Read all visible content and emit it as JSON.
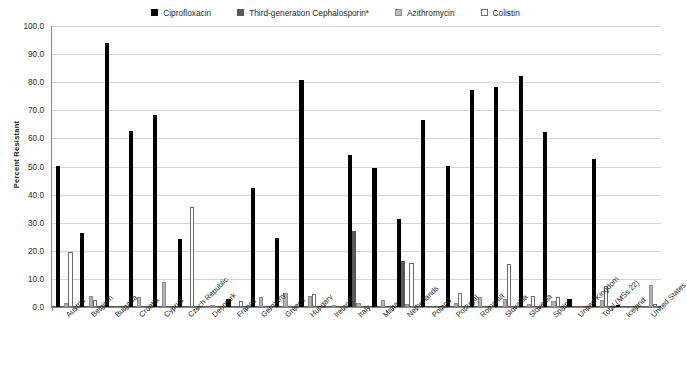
{
  "chart_data": {
    "type": "bar",
    "title": "",
    "xlabel": "",
    "ylabel": "Percent Resistant",
    "ylim": [
      0,
      100
    ],
    "yticks": [
      "0.0",
      "10.0",
      "20.0",
      "30.0",
      "40.0",
      "50.0",
      "60.0",
      "70.0",
      "80.0",
      "90.0",
      "100.0"
    ],
    "grid": true,
    "legend_position": "top-center",
    "categories": [
      "Austria",
      "Belgium",
      "Bulgaria",
      "Croatia",
      "Cyprus",
      "Czech Republic",
      "Denmark",
      "France",
      "Germany",
      "Greece",
      "Hungary",
      "Ireland",
      "Italy",
      "Malta",
      "Netherlands",
      "Poland",
      "Portugal",
      "Romania",
      "Slovakia",
      "Slovenia",
      "Spain",
      "United Kingdom",
      "Total (MSs 22)",
      "Iceland",
      "United States"
    ],
    "series": [
      {
        "name": "Ciprofloxacin",
        "color": "#000000",
        "values": [
          50.3,
          26.2,
          94.0,
          62.5,
          68.5,
          24.3,
          0.0,
          2.8,
          42.5,
          24.7,
          80.7,
          0.0,
          54.0,
          49.5,
          31.2,
          66.5,
          50.3,
          77.3,
          78.3,
          82.3,
          62.3,
          2.8,
          52.5,
          0.6,
          0.0
        ]
      },
      {
        "name": "Third-generation Cephalosporin*",
        "color": "#58585a",
        "values": [
          0.0,
          0.0,
          0.0,
          0.0,
          0.0,
          0.0,
          0.0,
          0.0,
          0.0,
          0.0,
          0.0,
          0.0,
          27.0,
          0.0,
          16.5,
          0.0,
          0.0,
          0.0,
          0.0,
          0.0,
          0.0,
          0.0,
          0.0,
          0.0,
          0.0
        ]
      },
      {
        "name": "Azithromycin",
        "color": "#b4b4b4",
        "values": [
          1.5,
          4.0,
          0.0,
          3.5,
          9.0,
          0.0,
          0.3,
          0.0,
          3.5,
          5.0,
          4.0,
          0.4,
          1.5,
          2.5,
          1.2,
          0.0,
          1.5,
          3.5,
          3.0,
          1.0,
          2.0,
          0.0,
          2.5,
          0.0,
          8.0
        ]
      },
      {
        "name": "Colistin",
        "color": "#ffffff",
        "values": [
          19.5,
          2.5,
          0.0,
          0.0,
          0.0,
          35.7,
          0.0,
          2.0,
          0.0,
          0.0,
          4.5,
          0.0,
          0.0,
          0.0,
          15.5,
          0.0,
          5.0,
          0.0,
          15.3,
          4.0,
          3.5,
          0.0,
          7.5,
          0.0,
          1.0
        ]
      }
    ]
  },
  "legend": {
    "items": [
      {
        "label": "Ciprofloxacin",
        "swatch": "square-filled-black-icon"
      },
      {
        "label": "Third-generation Cephalosporin*",
        "swatch": "square-filled-darkgray-icon"
      },
      {
        "label": "Azithromycin",
        "swatch": "square-filled-lightgray-icon"
      },
      {
        "label": "Colistin",
        "swatch": "square-outline-white-icon"
      }
    ]
  }
}
